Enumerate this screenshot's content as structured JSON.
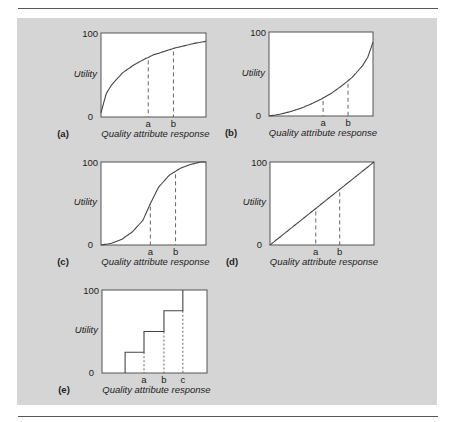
{
  "figure": {
    "panel_background": "#d5d5d5",
    "line_color": "#444444"
  },
  "chart_data": [
    {
      "id": "a",
      "type": "line",
      "panel_label": "(a)",
      "shape": "concave (diminishing returns)",
      "xlabel": "Quality attribute response",
      "ylabel": "Utility",
      "ylim": [
        0,
        100
      ],
      "y_ticks": [
        "0",
        "100"
      ],
      "x_markers": [
        "a",
        "b"
      ],
      "x": [
        0,
        0.05,
        0.1,
        0.2,
        0.3,
        0.4,
        0.5,
        0.6,
        0.7,
        0.8,
        0.9,
        1.0
      ],
      "values": [
        5,
        28,
        38,
        52,
        61,
        68,
        74,
        78,
        82,
        85,
        88,
        90
      ],
      "marker_positions": {
        "a": 0.45,
        "b": 0.69
      }
    },
    {
      "id": "b",
      "type": "line",
      "panel_label": "(b)",
      "shape": "convex (increasing returns)",
      "xlabel": "Quality attribute response",
      "ylabel": "Utility",
      "ylim": [
        0,
        100
      ],
      "y_ticks": [
        "0",
        "100"
      ],
      "x_markers": [
        "a",
        "b"
      ],
      "x": [
        0,
        0.1,
        0.2,
        0.3,
        0.4,
        0.5,
        0.6,
        0.7,
        0.8,
        0.9,
        0.95,
        1.0
      ],
      "values": [
        0,
        2,
        5,
        9,
        14,
        20,
        27,
        36,
        46,
        60,
        70,
        88
      ],
      "marker_positions": {
        "a": 0.52,
        "b": 0.76
      }
    },
    {
      "id": "c",
      "type": "line",
      "panel_label": "(c)",
      "shape": "S-curve (sigmoid)",
      "xlabel": "Quality attribute response",
      "ylabel": "Utility",
      "ylim": [
        0,
        100
      ],
      "y_ticks": [
        "0",
        "100"
      ],
      "x_markers": [
        "a",
        "b"
      ],
      "x": [
        0,
        0.1,
        0.2,
        0.3,
        0.4,
        0.47,
        0.55,
        0.65,
        0.75,
        0.85,
        0.95,
        1.0
      ],
      "values": [
        0,
        2,
        7,
        16,
        30,
        50,
        70,
        84,
        92,
        97,
        100,
        100
      ],
      "marker_positions": {
        "a": 0.47,
        "b": 0.71
      }
    },
    {
      "id": "d",
      "type": "line",
      "panel_label": "(d)",
      "shape": "linear",
      "xlabel": "Quality attribute response",
      "ylabel": "Utility",
      "ylim": [
        0,
        100
      ],
      "y_ticks": [
        "0",
        "100"
      ],
      "x_markers": [
        "a",
        "b"
      ],
      "x": [
        0,
        1
      ],
      "values": [
        0,
        100
      ],
      "marker_positions": {
        "a": 0.44,
        "b": 0.67
      }
    },
    {
      "id": "e",
      "type": "line",
      "panel_label": "(e)",
      "shape": "step function",
      "xlabel": "Quality attribute response",
      "ylabel": "Utility",
      "ylim": [
        0,
        100
      ],
      "y_ticks": [
        "0",
        "100"
      ],
      "x_markers": [
        "a",
        "b",
        "c"
      ],
      "steps": [
        {
          "x_start": 0.22,
          "x_end": 0.4,
          "value": 25
        },
        {
          "x_start": 0.4,
          "x_end": 0.59,
          "value": 50
        },
        {
          "x_start": 0.59,
          "x_end": 0.77,
          "value": 75
        },
        {
          "x_start": 0.77,
          "x_end": 0.77,
          "value": 100
        }
      ],
      "marker_positions": {
        "a": 0.4,
        "b": 0.59,
        "c": 0.77
      }
    }
  ]
}
